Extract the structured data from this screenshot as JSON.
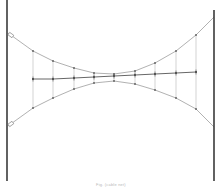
{
  "diagram": {
    "type": "cable-net",
    "caption": "Fig. (cable net)",
    "colors": {
      "pole": "#3a3a3a",
      "cable": "#a8a8a8",
      "tie": "#b5b5b5",
      "middle": "#555555",
      "node": "#555555"
    },
    "poles": {
      "left": {
        "x": 7,
        "y1": 0,
        "y2": 181
      },
      "right": {
        "x": 214,
        "y1": 10,
        "y2": 181
      }
    },
    "upper_cable": [
      [
        8,
        33
      ],
      [
        33,
        51
      ],
      [
        53,
        61
      ],
      [
        74,
        68
      ],
      [
        94,
        73
      ],
      [
        114,
        74
      ],
      [
        135,
        71
      ],
      [
        155,
        63
      ],
      [
        176,
        51
      ],
      [
        196,
        35
      ],
      [
        214,
        17
      ]
    ],
    "middle_line": [
      [
        33,
        79
      ],
      [
        53,
        79
      ],
      [
        74,
        78
      ],
      [
        94,
        77
      ],
      [
        114,
        76
      ],
      [
        135,
        75
      ],
      [
        155,
        74
      ],
      [
        176,
        73
      ],
      [
        196,
        72
      ]
    ],
    "lower_cable": [
      [
        8,
        126
      ],
      [
        33,
        108
      ],
      [
        53,
        98
      ],
      [
        74,
        89
      ],
      [
        94,
        83
      ],
      [
        114,
        81
      ],
      [
        135,
        84
      ],
      [
        155,
        90
      ],
      [
        176,
        98
      ],
      [
        196,
        109
      ],
      [
        214,
        127
      ]
    ]
  }
}
